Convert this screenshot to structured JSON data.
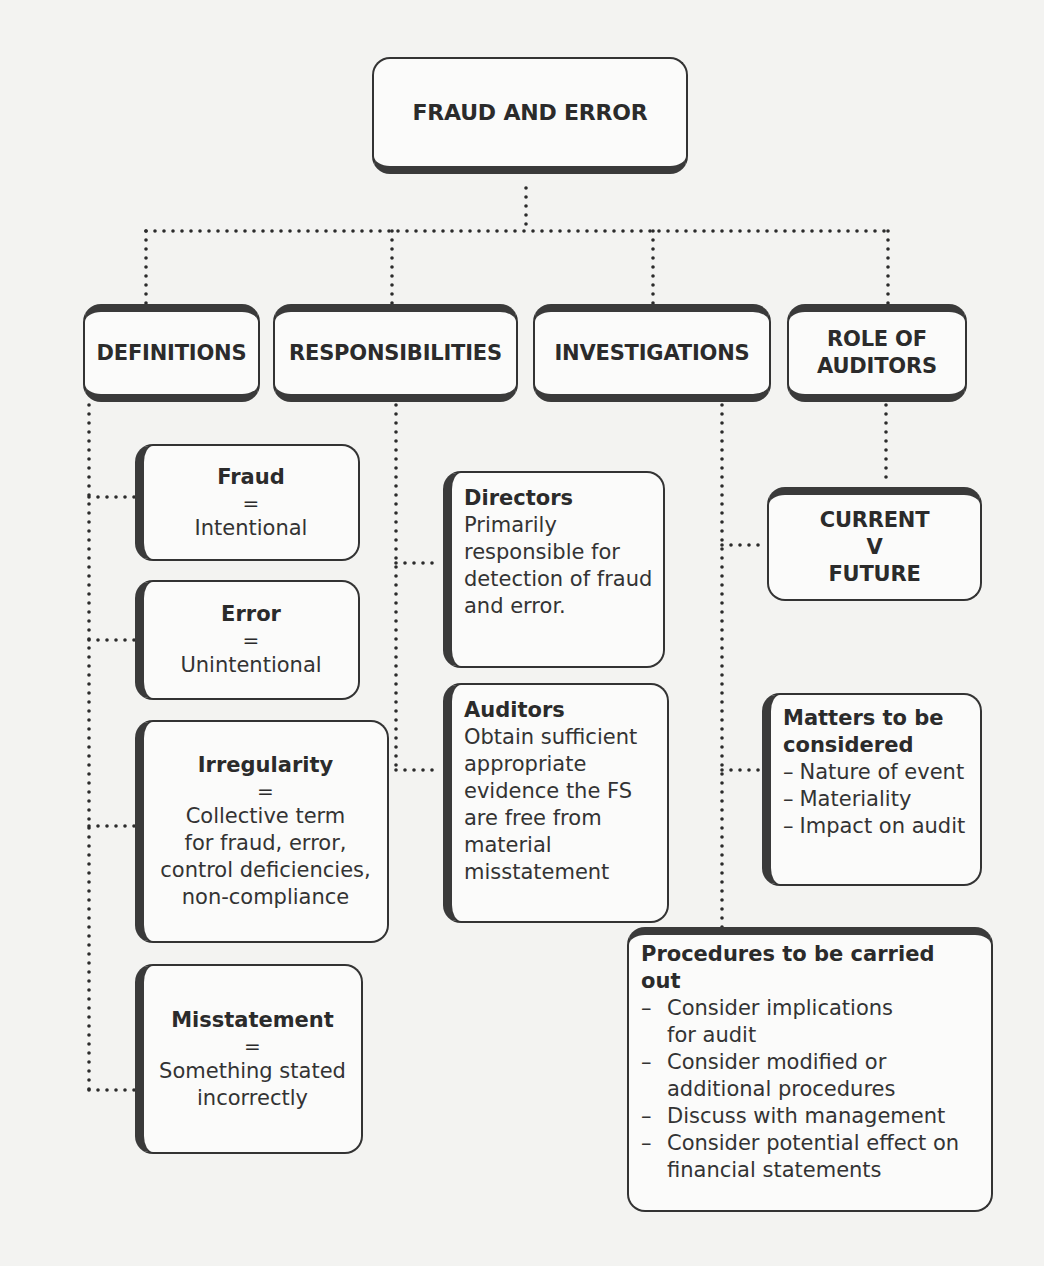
{
  "diagram": {
    "title": "FRAUD AND ERROR",
    "categories": [
      {
        "label": "DEFINITIONS"
      },
      {
        "label": "RESPONSIBILITIES"
      },
      {
        "label": "INVESTIGATIONS"
      },
      {
        "label_line1": "ROLE OF",
        "label_line2": "AUDITORS"
      }
    ],
    "definitions": [
      {
        "term": "Fraud",
        "equals": "=",
        "lines": [
          "Intentional"
        ]
      },
      {
        "term": "Error",
        "equals": "=",
        "lines": [
          "Unintentional"
        ]
      },
      {
        "term": "Irregularity",
        "equals": "=",
        "lines": [
          "Collective term",
          "for fraud, error,",
          "control deficiencies,",
          "non-compliance"
        ]
      },
      {
        "term": "Misstatement",
        "equals": "=",
        "lines": [
          "Something stated",
          "incorrectly"
        ]
      }
    ],
    "responsibilities": [
      {
        "party": "Directors",
        "lines": [
          "Primarily",
          "responsible for",
          "detection of fraud",
          "and error."
        ]
      },
      {
        "party": "Auditors",
        "lines": [
          "Obtain sufficient",
          "appropriate",
          "evidence the FS",
          "are free from",
          "material",
          "misstatement"
        ]
      }
    ],
    "role_of_auditors": {
      "line1": "CURRENT",
      "line2": "V",
      "line3": "FUTURE"
    },
    "matters": {
      "heading_line1": "Matters to be",
      "heading_line2": "considered",
      "dash": "–",
      "items": [
        "Nature of event",
        "Materiality",
        "Impact on audit"
      ]
    },
    "procedures": {
      "heading": "Procedures to be carried out",
      "dash": "–",
      "items": [
        {
          "line1": "Consider implications",
          "line2": "for audit"
        },
        {
          "line1": "Consider modified or",
          "line2": "additional procedures"
        },
        {
          "line1": "Discuss with management"
        },
        {
          "line1": "Consider potential effect on",
          "line2": "financial statements"
        }
      ]
    }
  }
}
